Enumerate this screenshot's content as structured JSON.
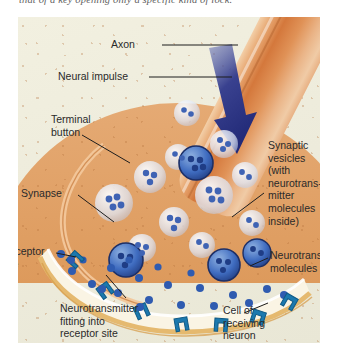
{
  "caption": {
    "text": "that of a key opening only a specific kind of lock."
  },
  "figure": {
    "colors": {
      "background": "#efeede",
      "axon": "#d4783c",
      "terminal_button": "#d97c3a",
      "impulse_arrow": "#2c3a8c",
      "vesicle_fill": "#cfd9ef",
      "neurotransmitter": "#3a5fad",
      "receptor_site": "#1f76a8",
      "receiving_neuron": "#dfa064",
      "cleft": "#fdfaf0",
      "membrane": "#e8bb72"
    },
    "labels": [
      {
        "id": "axon",
        "text": "Axon"
      },
      {
        "id": "neural-impulse",
        "text": "Neural impulse"
      },
      {
        "id": "terminal-button",
        "text": "Terminal\nbutton"
      },
      {
        "id": "synapse",
        "text": "Synapse"
      },
      {
        "id": "synaptic-vesicles",
        "text": "Synaptic\nvesicles\n(with\nneurotrans-\nmitter\nmolecules\ninside)"
      },
      {
        "id": "neurotransmitter-molecules",
        "text": "Neurotransmitter\nmolecules"
      },
      {
        "id": "receptor-site",
        "text": "Receptor\nsite"
      },
      {
        "id": "neurotransmitter-fitting",
        "text": "Neurotransmitter\nfitting into\nreceptor site"
      },
      {
        "id": "cell-of-receiving-neuron",
        "text": "Cell of\nreceiving\nneuron"
      }
    ]
  }
}
